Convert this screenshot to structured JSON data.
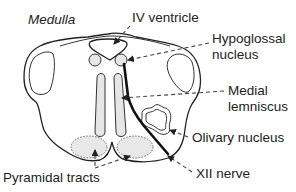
{
  "diagram": {
    "title": "Medulla",
    "labels": {
      "iv_ventricle": "IV ventricle",
      "hypoglossal_line1": "Hypoglossal",
      "hypoglossal_line2": "nucleus",
      "medial_line1": "Medial",
      "medial_line2": "lemniscus",
      "olivary": "Olivary nucleus",
      "xii_nerve": "XII nerve",
      "pyramidal": "Pyramidal tracts"
    },
    "colors": {
      "line": "#222222",
      "shade": "#e6e6e6",
      "background": "#ffffff"
    }
  }
}
